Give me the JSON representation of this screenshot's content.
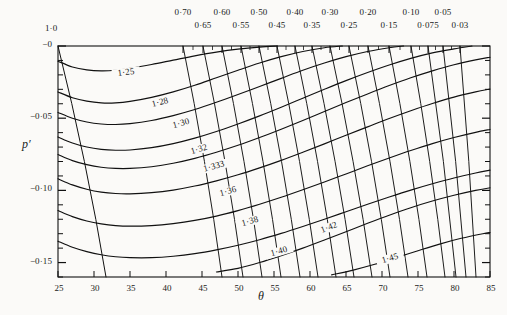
{
  "figure": {
    "kind": "contour-nomogram",
    "background": "#fbfaf8",
    "ink": "#111111"
  },
  "axes": {
    "x_label": "θ",
    "y_label": "p′",
    "x_ticks": [
      "25",
      "30",
      "35",
      "40",
      "45",
      "50",
      "55",
      "60",
      "65",
      "70",
      "75",
      "80",
      "85"
    ],
    "y_ticks": [
      "−0",
      "−0·05",
      "−0·10",
      "−0·15"
    ],
    "top_label_corner": "1·0",
    "top_ticks_upper": [
      "0·70",
      "0·60",
      "0·50",
      "0·40",
      "0·30",
      "0·20",
      "0·10",
      "0·05"
    ],
    "top_ticks_lower": [
      "0·65",
      "0·55",
      "0·45",
      "0·35",
      "0·25",
      "0·15",
      "0·075",
      "0·03"
    ]
  },
  "contour_labels": [
    "1·25",
    "1·28",
    "1·30",
    "1·32",
    "1·333",
    "1·36",
    "1·38",
    "1·40",
    "1·42",
    "1·45"
  ],
  "chart_data": {
    "type": "line",
    "title": "",
    "xlabel": "θ",
    "ylabel": "p′",
    "xlim": [
      25,
      85
    ],
    "ylim": [
      -0.16,
      0.0
    ],
    "grid": false,
    "legend": "none",
    "x_major_step": 5,
    "y_major_step": 0.05,
    "y_minor_step": 0.01,
    "top_axis": {
      "label_corner": "1·0",
      "values": [
        0.7,
        0.65,
        0.6,
        0.55,
        0.5,
        0.45,
        0.4,
        0.35,
        0.3,
        0.25,
        0.2,
        0.15,
        0.1,
        0.075,
        0.05,
        0.03
      ],
      "x_px": [
        183,
        203,
        222,
        241,
        259,
        277,
        295,
        312,
        330,
        349,
        368,
        389,
        411,
        428,
        443,
        460
      ],
      "row": [
        "upper",
        "lower",
        "upper",
        "lower",
        "upper",
        "lower",
        "upper",
        "lower",
        "upper",
        "lower",
        "upper",
        "lower",
        "upper",
        "lower",
        "upper",
        "lower"
      ]
    },
    "series": [
      {
        "name": "1·25",
        "label": "1·25",
        "type": "contour",
        "label_pos": [
          34.3,
          -0.0185
        ],
        "points": [
          [
            25,
            -0.0105
          ],
          [
            27,
            -0.0145
          ],
          [
            29,
            -0.0165
          ],
          [
            31,
            -0.0172
          ],
          [
            33,
            -0.0168
          ],
          [
            35,
            -0.0155
          ],
          [
            38,
            -0.0128
          ],
          [
            41,
            -0.0098
          ],
          [
            44,
            -0.0068
          ],
          [
            47,
            -0.0042
          ],
          [
            50,
            -0.0022
          ],
          [
            53,
            -0.0008
          ],
          [
            55.5,
            0.0
          ]
        ]
      },
      {
        "name": "1·28",
        "label": "1·28",
        "type": "contour",
        "label_pos": [
          39.0,
          -0.0397
        ],
        "points": [
          [
            25,
            -0.0318
          ],
          [
            27,
            -0.0358
          ],
          [
            29,
            -0.0382
          ],
          [
            31,
            -0.0394
          ],
          [
            33,
            -0.0394
          ],
          [
            35,
            -0.0384
          ],
          [
            38,
            -0.0356
          ],
          [
            41,
            -0.0318
          ],
          [
            44,
            -0.0272
          ],
          [
            47,
            -0.022
          ],
          [
            50,
            -0.0168
          ],
          [
            53,
            -0.0118
          ],
          [
            56,
            -0.0074
          ],
          [
            59,
            -0.0038
          ],
          [
            62,
            -0.0012
          ],
          [
            64.5,
            0.0
          ]
        ]
      },
      {
        "name": "1·30",
        "label": "1·30",
        "type": "contour",
        "label_pos": [
          42.0,
          -0.0542
        ],
        "points": [
          [
            25,
            -0.046
          ],
          [
            27,
            -0.05
          ],
          [
            29,
            -0.0526
          ],
          [
            31,
            -0.054
          ],
          [
            33,
            -0.0544
          ],
          [
            35,
            -0.0538
          ],
          [
            38,
            -0.0516
          ],
          [
            41,
            -0.0482
          ],
          [
            44,
            -0.044
          ],
          [
            47,
            -0.039
          ],
          [
            50,
            -0.0336
          ],
          [
            53,
            -0.028
          ],
          [
            56,
            -0.0224
          ],
          [
            59,
            -0.0168
          ],
          [
            62,
            -0.0118
          ],
          [
            65,
            -0.0074
          ],
          [
            68,
            -0.0038
          ],
          [
            71,
            -0.0012
          ],
          [
            73,
            0.0
          ]
        ]
      },
      {
        "name": "1·32",
        "label": "1·32",
        "type": "contour",
        "label_pos": [
          44.5,
          -0.0718
        ],
        "points": [
          [
            25,
            -0.063
          ],
          [
            27,
            -0.0672
          ],
          [
            29,
            -0.07
          ],
          [
            31,
            -0.0716
          ],
          [
            33,
            -0.0722
          ],
          [
            35,
            -0.072
          ],
          [
            38,
            -0.0704
          ],
          [
            41,
            -0.0676
          ],
          [
            44,
            -0.0638
          ],
          [
            47,
            -0.0592
          ],
          [
            50,
            -0.054
          ],
          [
            53,
            -0.0484
          ],
          [
            56,
            -0.0424
          ],
          [
            59,
            -0.0362
          ],
          [
            62,
            -0.03
          ],
          [
            65,
            -0.024
          ],
          [
            68,
            -0.0184
          ],
          [
            71,
            -0.0132
          ],
          [
            74,
            -0.0086
          ],
          [
            77,
            -0.0048
          ],
          [
            80,
            -0.002
          ],
          [
            82.5,
            0.0
          ]
        ]
      },
      {
        "name": "1·333",
        "label": "1·333",
        "type": "contour",
        "label_pos": [
          46.5,
          -0.0838
        ],
        "points": [
          [
            25,
            -0.0752
          ],
          [
            27,
            -0.0794
          ],
          [
            29,
            -0.0822
          ],
          [
            31,
            -0.084
          ],
          [
            33,
            -0.0848
          ],
          [
            35,
            -0.0848
          ],
          [
            38,
            -0.0836
          ],
          [
            41,
            -0.0812
          ],
          [
            44,
            -0.0778
          ],
          [
            47,
            -0.0736
          ],
          [
            50,
            -0.0688
          ],
          [
            53,
            -0.0634
          ],
          [
            56,
            -0.0576
          ],
          [
            59,
            -0.0516
          ],
          [
            62,
            -0.0454
          ],
          [
            65,
            -0.0392
          ],
          [
            68,
            -0.0332
          ],
          [
            71,
            -0.0274
          ],
          [
            74,
            -0.022
          ],
          [
            77,
            -0.0172
          ],
          [
            80,
            -0.013
          ],
          [
            83,
            -0.0096
          ],
          [
            85,
            -0.0078
          ]
        ]
      },
      {
        "name": "1·36",
        "label": "1·36",
        "type": "contour",
        "label_pos": [
          48.5,
          -0.1008
        ],
        "points": [
          [
            25,
            -0.092
          ],
          [
            27,
            -0.0962
          ],
          [
            29,
            -0.0992
          ],
          [
            31,
            -0.1012
          ],
          [
            33,
            -0.1022
          ],
          [
            35,
            -0.1024
          ],
          [
            38,
            -0.1016
          ],
          [
            41,
            -0.0998
          ],
          [
            44,
            -0.097
          ],
          [
            47,
            -0.0934
          ],
          [
            50,
            -0.0892
          ],
          [
            53,
            -0.0844
          ],
          [
            56,
            -0.0792
          ],
          [
            59,
            -0.0736
          ],
          [
            62,
            -0.0678
          ],
          [
            65,
            -0.0618
          ],
          [
            68,
            -0.056
          ],
          [
            71,
            -0.0502
          ],
          [
            74,
            -0.0448
          ],
          [
            77,
            -0.0398
          ],
          [
            80,
            -0.0354
          ],
          [
            83,
            -0.0318
          ],
          [
            85,
            -0.0298
          ]
        ]
      },
      {
        "name": "1·38",
        "label": "1·38",
        "type": "contour",
        "label_pos": [
          51.5,
          -0.1222
        ],
        "points": [
          [
            25,
            -0.114
          ],
          [
            27,
            -0.1182
          ],
          [
            29,
            -0.1212
          ],
          [
            31,
            -0.1232
          ],
          [
            33,
            -0.1244
          ],
          [
            35,
            -0.1248
          ],
          [
            38,
            -0.1244
          ],
          [
            41,
            -0.123
          ],
          [
            44,
            -0.1208
          ],
          [
            47,
            -0.1178
          ],
          [
            50,
            -0.114
          ],
          [
            53,
            -0.1096
          ],
          [
            56,
            -0.1048
          ],
          [
            59,
            -0.0996
          ],
          [
            62,
            -0.0942
          ],
          [
            65,
            -0.0886
          ],
          [
            68,
            -0.083
          ],
          [
            71,
            -0.0776
          ],
          [
            74,
            -0.0724
          ],
          [
            77,
            -0.0676
          ],
          [
            80,
            -0.0634
          ],
          [
            83,
            -0.0598
          ],
          [
            85,
            -0.0578
          ]
        ]
      },
      {
        "name": "1·40",
        "label": "1·40",
        "type": "contour",
        "label_pos": [
          55.5,
          -0.1425
        ],
        "points": [
          [
            25,
            -0.1352
          ],
          [
            27,
            -0.1394
          ],
          [
            29,
            -0.1424
          ],
          [
            31,
            -0.1446
          ],
          [
            33,
            -0.146
          ],
          [
            35,
            -0.1466
          ],
          [
            38,
            -0.1466
          ],
          [
            41,
            -0.1456
          ],
          [
            44,
            -0.1438
          ],
          [
            47,
            -0.1412
          ],
          [
            50,
            -0.138
          ],
          [
            53,
            -0.1342
          ],
          [
            56,
            -0.1298
          ],
          [
            59,
            -0.125
          ],
          [
            62,
            -0.12
          ],
          [
            65,
            -0.1148
          ],
          [
            68,
            -0.1096
          ],
          [
            71,
            -0.1046
          ],
          [
            74,
            -0.0998
          ],
          [
            77,
            -0.0954
          ],
          [
            80,
            -0.0914
          ],
          [
            83,
            -0.088
          ],
          [
            85,
            -0.086
          ]
        ]
      },
      {
        "name": "1·42",
        "label": "1·42",
        "type": "contour-partial",
        "label_pos": [
          62.5,
          -0.1262
        ],
        "points": [
          [
            47,
            -0.1565
          ],
          [
            50,
            -0.154
          ],
          [
            53,
            -0.15
          ],
          [
            56,
            -0.1452
          ],
          [
            59,
            -0.14
          ],
          [
            62,
            -0.1344
          ],
          [
            65,
            -0.1286
          ],
          [
            68,
            -0.1228
          ],
          [
            71,
            -0.1172
          ],
          [
            74,
            -0.112
          ],
          [
            77,
            -0.1074
          ],
          [
            80,
            -0.1034
          ],
          [
            83,
            -0.1
          ],
          [
            85,
            -0.0982
          ]
        ]
      },
      {
        "name": "1·45",
        "label": "1·45",
        "type": "contour-partial",
        "label_pos": [
          71.0,
          -0.1478
        ],
        "points": [
          [
            63,
            -0.1585
          ],
          [
            66,
            -0.1552
          ],
          [
            69,
            -0.1512
          ],
          [
            72,
            -0.1466
          ],
          [
            75,
            -0.1418
          ],
          [
            78,
            -0.1372
          ],
          [
            81,
            -0.1332
          ],
          [
            84,
            -0.13
          ],
          [
            85,
            -0.1292
          ]
        ]
      }
    ],
    "diagonals": {
      "description": "family of near-straight lines rising from lower-left toward the labelled ticks on the top axis",
      "top_x_px": [
        58,
        183,
        203,
        222,
        241,
        259,
        277,
        295,
        312,
        330,
        349,
        368,
        389,
        411,
        428,
        443,
        460
      ],
      "bottom_x_px": [
        106,
        222,
        243,
        262,
        281,
        300,
        318,
        336,
        354,
        372,
        390,
        408,
        427,
        445,
        456,
        466,
        476
      ]
    }
  }
}
